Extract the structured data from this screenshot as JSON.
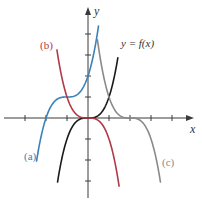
{
  "chart_data": {
    "type": "line",
    "title": "",
    "xlabel": "x",
    "ylabel": "y",
    "origin_px": [
      88,
      118
    ],
    "unit_px": 21,
    "xlim": [
      -4,
      5
    ],
    "ylim": [
      -3.8,
      5
    ],
    "x_ticks": [
      -3,
      -2,
      -1,
      1,
      2,
      3,
      4
    ],
    "y_ticks": [
      -3,
      -2,
      -1,
      1,
      2,
      3,
      4
    ],
    "grid": false,
    "series": [
      {
        "name": "y = f(x)",
        "formula": "x^3",
        "color": "#1a1a1a",
        "domain": [
          -1.45,
          1.42
        ],
        "label": "y = f(x)",
        "label_pos": [
          121,
          47
        ]
      },
      {
        "name": "(a)",
        "formula": "(x+1)^3 + 1",
        "color": "#3b82b8",
        "domain": [
          -2.45,
          0.5
        ],
        "label": "(a)",
        "label_pos": [
          24,
          160
        ]
      },
      {
        "name": "(b)",
        "formula": "-x^3",
        "color": "#b03a48",
        "domain": [
          -1.48,
          1.48
        ],
        "label": "(b)",
        "label_pos": [
          40,
          49
        ]
      },
      {
        "name": "(c)",
        "formula": "-(x-2)^3",
        "color": "#8a8a8a",
        "domain": [
          0.45,
          3.45
        ],
        "label": "(c)",
        "label_pos": [
          162,
          166
        ]
      }
    ]
  }
}
